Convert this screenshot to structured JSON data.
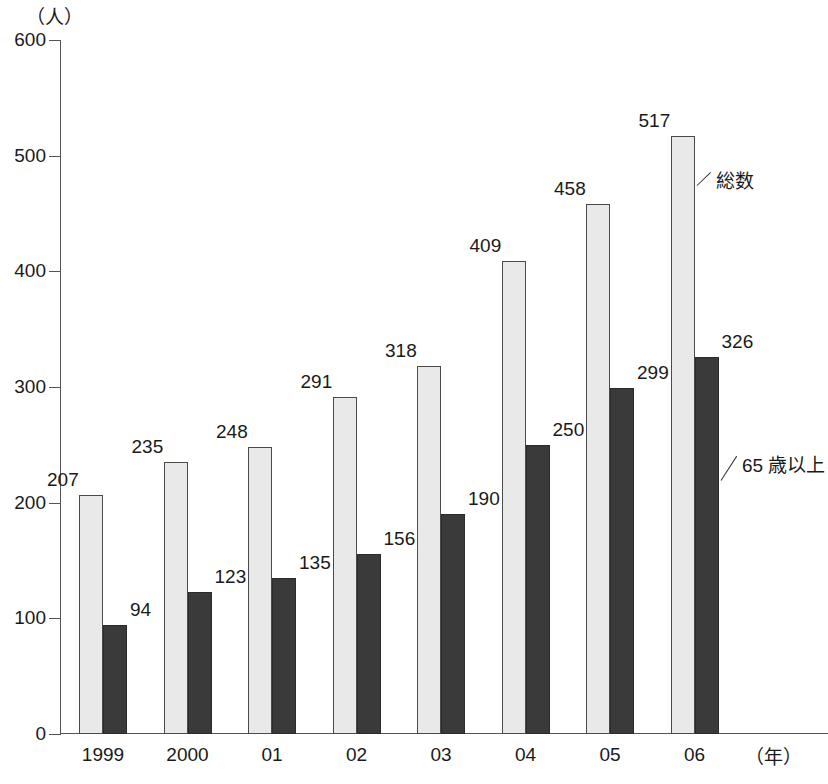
{
  "chart_data": {
    "type": "bar",
    "title": "",
    "subtitle": "",
    "xlabel": "（年）",
    "ylabel": "（人）",
    "ylim": [
      0,
      600
    ],
    "ytick_step": 100,
    "yticks": [
      "0",
      "100",
      "200",
      "300",
      "400",
      "500",
      "600"
    ],
    "grid": false,
    "legend_position": "inline-annotations",
    "categories": [
      "1999",
      "2000",
      "01",
      "02",
      "03",
      "04",
      "05",
      "06"
    ],
    "series": [
      {
        "name": "総数",
        "color": "#e9e9e9",
        "values": [
          207,
          235,
          248,
          291,
          318,
          409,
          458,
          517
        ]
      },
      {
        "name": "65 歳以上",
        "color": "#3a3a3a",
        "values": [
          94,
          123,
          135,
          156,
          190,
          250,
          299,
          326
        ]
      }
    ],
    "annotations": [
      {
        "text": "総数",
        "points_to": "total-bar-2006"
      },
      {
        "text": "65 歳以上",
        "points_to": "elderly-bar-2006"
      }
    ]
  }
}
